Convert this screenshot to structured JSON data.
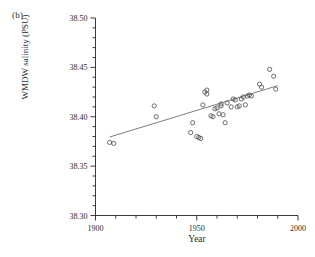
{
  "figure": {
    "panel_label": "(b)",
    "background": "#ffffff"
  },
  "axes": {
    "x": {
      "label": "Year",
      "min": 1900,
      "max": 2000,
      "major_ticks": [
        1900,
        1950,
        2000
      ],
      "major_tick_labels": [
        "1900",
        "1950",
        "2000"
      ],
      "minor_tick_step": 10,
      "tick_label_0": "1900",
      "tick_label_1": "1950",
      "tick_label_2": "2000"
    },
    "y": {
      "label": "WMDW salinity (PSU)",
      "min": 38.3,
      "max": 38.5,
      "major_ticks": [
        38.3,
        38.35,
        38.4,
        38.45,
        38.5
      ],
      "major_tick_labels": [
        "38.30",
        "38.35",
        "38.40",
        "38.45",
        "38.50"
      ],
      "minor_tick_step": 0.01,
      "tick_label_0": "38.30",
      "tick_label_1": "38.35",
      "tick_label_2": "38.40",
      "tick_label_3": "38.45",
      "tick_label_4": "38.50"
    }
  },
  "style": {
    "axis_color": "#3a3a3a",
    "marker_color": "#4a4a4a",
    "line_color": "#6e6e6e",
    "marker_radius": 2.1,
    "marker_fill": "none"
  },
  "chart_data": {
    "type": "scatter",
    "title": "",
    "subtitle": "",
    "xlabel": "Year",
    "ylabel": "WMDW salinity (PSU)",
    "xlim": [
      1900,
      2000
    ],
    "ylim": [
      38.3,
      38.5
    ],
    "grid": false,
    "legend": null,
    "annotations": [
      {
        "text": "(b)",
        "position": "top-left"
      }
    ],
    "series": [
      {
        "name": "WMDW salinity observations",
        "marker": "open-circle",
        "points": [
          {
            "x": 1907,
            "y": 38.374
          },
          {
            "x": 1909,
            "y": 38.373
          },
          {
            "x": 1929,
            "y": 38.411
          },
          {
            "x": 1930,
            "y": 38.4
          },
          {
            "x": 1947,
            "y": 38.384
          },
          {
            "x": 1948,
            "y": 38.394
          },
          {
            "x": 1950,
            "y": 38.38
          },
          {
            "x": 1951,
            "y": 38.379
          },
          {
            "x": 1952,
            "y": 38.378
          },
          {
            "x": 1953,
            "y": 38.412
          },
          {
            "x": 1954,
            "y": 38.425
          },
          {
            "x": 1955,
            "y": 38.423
          },
          {
            "x": 1955,
            "y": 38.427
          },
          {
            "x": 1957,
            "y": 38.401
          },
          {
            "x": 1958,
            "y": 38.4
          },
          {
            "x": 1959,
            "y": 38.408
          },
          {
            "x": 1960,
            "y": 38.409
          },
          {
            "x": 1961,
            "y": 38.403
          },
          {
            "x": 1962,
            "y": 38.411
          },
          {
            "x": 1962,
            "y": 38.413
          },
          {
            "x": 1963,
            "y": 38.402
          },
          {
            "x": 1964,
            "y": 38.394
          },
          {
            "x": 1965,
            "y": 38.414
          },
          {
            "x": 1967,
            "y": 38.41
          },
          {
            "x": 1968,
            "y": 38.418
          },
          {
            "x": 1969,
            "y": 38.417
          },
          {
            "x": 1970,
            "y": 38.41
          },
          {
            "x": 1971,
            "y": 38.411
          },
          {
            "x": 1972,
            "y": 38.418
          },
          {
            "x": 1973,
            "y": 38.42
          },
          {
            "x": 1974,
            "y": 38.412
          },
          {
            "x": 1975,
            "y": 38.421
          },
          {
            "x": 1976,
            "y": 38.422
          },
          {
            "x": 1977,
            "y": 38.421
          },
          {
            "x": 1981,
            "y": 38.433
          },
          {
            "x": 1982,
            "y": 38.43
          },
          {
            "x": 1986,
            "y": 38.448
          },
          {
            "x": 1988,
            "y": 38.441
          },
          {
            "x": 1989,
            "y": 38.428
          }
        ]
      }
    ],
    "trendline": {
      "name": "linear regression",
      "x_start": 1907,
      "y_start": 38.3795,
      "x_end": 1990,
      "y_end": 38.4315
    }
  }
}
